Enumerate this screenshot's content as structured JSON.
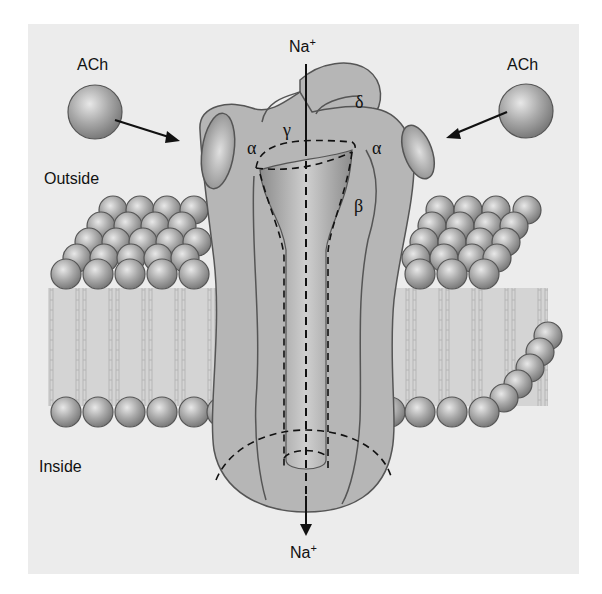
{
  "figure": {
    "labels": {
      "ach_left": "ACh",
      "ach_right": "ACh",
      "outside": "Outside",
      "inside": "Inside",
      "na_top": "Na",
      "na_top_charge": "+",
      "na_bottom": "Na",
      "na_bottom_charge": "+"
    },
    "subunits": {
      "alpha_left": "α",
      "gamma": "γ",
      "delta": "δ",
      "alpha_right": "α",
      "beta": "β"
    },
    "colors": {
      "panel": "#ececec",
      "protein": "#b4b4b4",
      "protein_outline": "#555555",
      "lipid_head": "#a8a8a8",
      "membrane_core": "#d2d2d2",
      "arrow": "#111111"
    }
  }
}
